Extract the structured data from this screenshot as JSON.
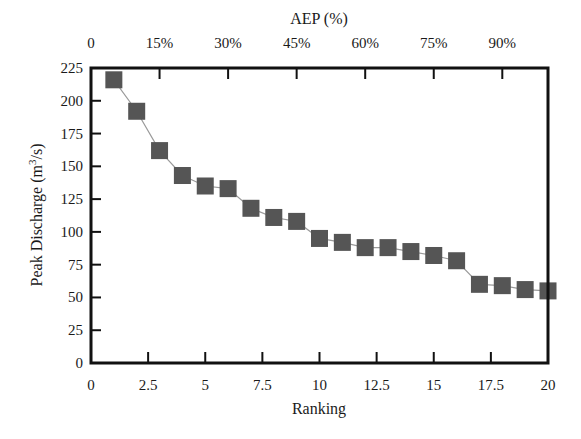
{
  "chart_data": {
    "type": "line",
    "title": "",
    "xlabel": "Ranking",
    "ylabel": "Peak Discharge (m3/s)",
    "ylabel_display": {
      "prefix": "Peak Discharge (m",
      "sup": "3",
      "suffix": "/s)"
    },
    "secondary_xlabel": "AEP (%)",
    "xlim": [
      0,
      20
    ],
    "ylim": [
      0,
      225
    ],
    "x_ticks": [
      "0",
      "2.5",
      "5",
      "7.5",
      "10",
      "12.5",
      "15",
      "17.5",
      "20"
    ],
    "x_tick_values": [
      0,
      2.5,
      5,
      7.5,
      10,
      12.5,
      15,
      17.5,
      20
    ],
    "y_ticks": [
      "0",
      "25",
      "50",
      "75",
      "100",
      "125",
      "150",
      "175",
      "200",
      "225"
    ],
    "y_tick_values": [
      0,
      25,
      50,
      75,
      100,
      125,
      150,
      175,
      200,
      225
    ],
    "secondary_x_ticks": [
      "0",
      "15%",
      "30%",
      "45%",
      "60%",
      "75%",
      "90%"
    ],
    "secondary_x_tick_values": [
      0,
      15,
      30,
      45,
      60,
      75,
      90
    ],
    "secondary_xlim": [
      0,
      100
    ],
    "grid": false,
    "legend": null,
    "marker": "square",
    "series": [
      {
        "name": "Peak Discharge",
        "x": [
          1,
          2,
          3,
          4,
          5,
          6,
          7,
          8,
          9,
          10,
          11,
          12,
          13,
          14,
          15,
          16,
          17,
          18,
          19,
          20
        ],
        "values": [
          216,
          192,
          162,
          143,
          135,
          133,
          118,
          111,
          108,
          95,
          92,
          88,
          88,
          85,
          82,
          78,
          60,
          59,
          56,
          55
        ]
      }
    ]
  },
  "colors": {
    "marker": "#555555",
    "line": "#9a9a9a",
    "axis": "#111111"
  }
}
